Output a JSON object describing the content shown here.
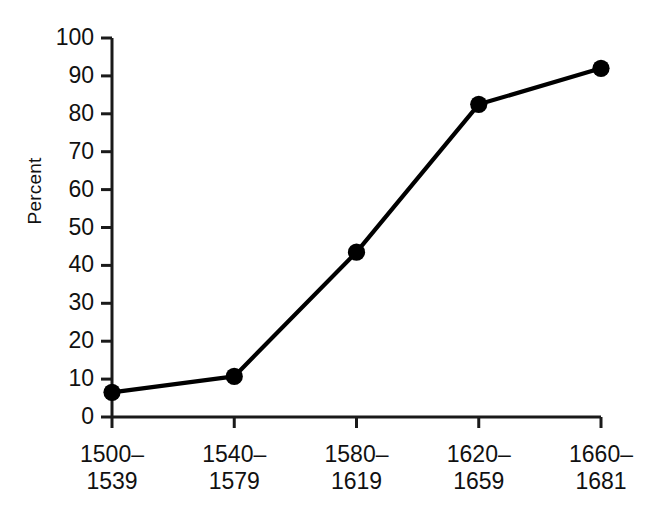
{
  "chart_data": {
    "type": "line",
    "title": "",
    "subtitle": "",
    "xlabel": "",
    "ylabel": "Percent",
    "categories": [
      "1500–1539",
      "1540–1579",
      "1580–1619",
      "1620–1659",
      "1660–1681"
    ],
    "category_lines": [
      {
        "line1": "1500–",
        "line2": "1539"
      },
      {
        "line1": "1540–",
        "line2": "1579"
      },
      {
        "line1": "1580–",
        "line2": "1619"
      },
      {
        "line1": "1620–",
        "line2": "1659"
      },
      {
        "line1": "1660–",
        "line2": "1681"
      }
    ],
    "values": [
      6.5,
      10.7,
      43.5,
      82.5,
      92.0
    ],
    "ylim": [
      0,
      100
    ],
    "ytick_labels": [
      "100",
      "90",
      "80",
      "70",
      "60",
      "50",
      "40",
      "30",
      "20",
      "10",
      "0"
    ],
    "ytick_values": [
      100,
      90,
      80,
      70,
      60,
      50,
      40,
      30,
      20,
      10,
      0
    ],
    "grid": false,
    "legend": null,
    "legend_position": "none",
    "marker": "filled-circle",
    "series_color": "#000000"
  }
}
